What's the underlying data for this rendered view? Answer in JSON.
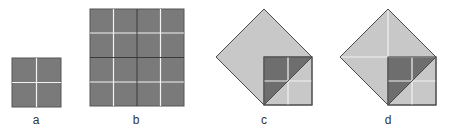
{
  "figures": [
    {
      "id": "a",
      "label": "a",
      "label_x": 36
    },
    {
      "id": "b",
      "label": "b",
      "label_x": 136
    },
    {
      "id": "c",
      "label": "c",
      "label_x": 264
    },
    {
      "id": "d",
      "label": "d",
      "label_x": 388
    }
  ],
  "colors": {
    "dark_fill": "#7a7a7a",
    "darker_fill": "#6e6e6e",
    "light_fill": "#c8c8c8",
    "outline": "#4a4a4a",
    "grid_white": "#f2f2f2",
    "grid_dark": "#3a3a3a"
  }
}
